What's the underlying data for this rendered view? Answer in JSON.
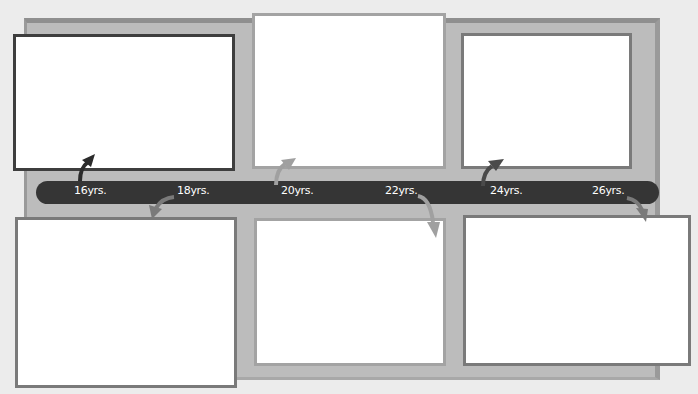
{
  "timeline": {
    "labels": [
      "16yrs.",
      "18yrs.",
      "20yrs.",
      "22yrs.",
      "24yrs.",
      "26yrs."
    ],
    "bar_color": "#353535",
    "board_color": "#bcbcbc"
  },
  "frames": [
    {
      "id": "16",
      "position": "top",
      "content": ""
    },
    {
      "id": "18",
      "position": "bottom",
      "content": ""
    },
    {
      "id": "20",
      "position": "top",
      "content": ""
    },
    {
      "id": "22",
      "position": "bottom",
      "content": ""
    },
    {
      "id": "24",
      "position": "top",
      "content": ""
    },
    {
      "id": "26",
      "position": "bottom",
      "content": ""
    }
  ]
}
